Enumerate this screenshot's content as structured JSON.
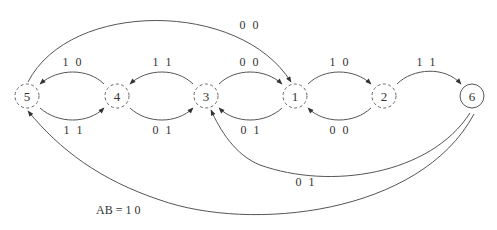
{
  "diagram": {
    "type": "state-diagram",
    "input_label": "AB = 1 0",
    "nodes": [
      {
        "id": "5",
        "label": "5",
        "style": "dashed"
      },
      {
        "id": "4",
        "label": "4",
        "style": "dashed"
      },
      {
        "id": "3",
        "label": "3",
        "style": "dashed"
      },
      {
        "id": "1",
        "label": "1",
        "style": "dashed"
      },
      {
        "id": "2",
        "label": "2",
        "style": "dashed"
      },
      {
        "id": "6",
        "label": "6",
        "style": "solid"
      }
    ],
    "edges": [
      {
        "from": "4",
        "to": "5",
        "label": "1 0"
      },
      {
        "from": "3",
        "to": "4",
        "label": "1 1"
      },
      {
        "from": "3",
        "to": "1",
        "label": "0 0"
      },
      {
        "from": "1",
        "to": "2",
        "label": "1 0"
      },
      {
        "from": "2",
        "to": "6",
        "label": "1 1"
      },
      {
        "from": "5",
        "to": "1",
        "label": "0 0"
      },
      {
        "from": "5",
        "to": "4",
        "label": "1 1"
      },
      {
        "from": "4",
        "to": "3",
        "label": "0 1"
      },
      {
        "from": "1",
        "to": "3",
        "label": "0 1"
      },
      {
        "from": "2",
        "to": "1",
        "label": "0 0"
      },
      {
        "from": "6",
        "to": "3",
        "label": "0 1"
      },
      {
        "from": "6",
        "to": "5",
        "label": "1 0"
      }
    ]
  }
}
